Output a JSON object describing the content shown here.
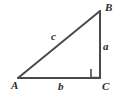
{
  "figure": {
    "type": "right-triangle-geometry-diagram",
    "background_color": "#ffffff",
    "stroke_color": "#4a4a4a",
    "stroke_width": 2,
    "label_color": "#2b2b2b",
    "vertices": [
      {
        "id": "A",
        "label": "A",
        "x": 18,
        "y": 78,
        "name": "vertex-a"
      },
      {
        "id": "B",
        "label": "B",
        "x": 100,
        "y": 11,
        "name": "vertex-b"
      },
      {
        "id": "C",
        "label": "C",
        "x": 100,
        "y": 78,
        "name": "vertex-c"
      }
    ],
    "sides": [
      {
        "id": "a",
        "label": "a",
        "from": "B",
        "to": "C",
        "name": "side-a-vertical"
      },
      {
        "id": "b",
        "label": "b",
        "from": "A",
        "to": "C",
        "name": "side-b-horizontal"
      },
      {
        "id": "c",
        "label": "c",
        "from": "A",
        "to": "B",
        "name": "side-c-hypotenuse"
      }
    ],
    "right_angle": {
      "at_vertex": "C",
      "marker": "square",
      "x": 91,
      "y": 69,
      "size": 9,
      "name": "right-angle-marker"
    }
  }
}
